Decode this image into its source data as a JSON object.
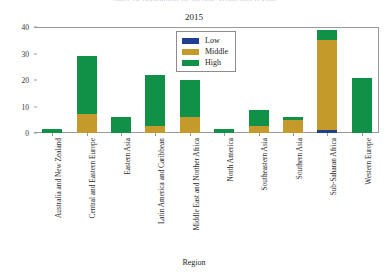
{
  "suptitle": "Share of population by income group and region",
  "axis_title_x": "Region",
  "legend": {
    "position": "top-center-inside",
    "items": [
      {
        "label": "Low",
        "color": "#1f3f8f"
      },
      {
        "label": "Middle",
        "color": "#c49a2b"
      },
      {
        "label": "High",
        "color": "#119148"
      }
    ]
  },
  "chart_data": {
    "type": "bar",
    "title": "2015",
    "xlabel": "Region",
    "ylabel": "",
    "stacked": true,
    "grid": false,
    "ylim": [
      0,
      40
    ],
    "yticks": [
      0,
      10,
      20,
      30,
      40
    ],
    "categories": [
      "Australia and New Zealand",
      "Central and Eastern Europe",
      "Eastern Asia",
      "Latin America and Caribbean",
      "Middle East and Norther Africa",
      "North America",
      "Southeastern Asia",
      "Southern Asia",
      "Sub-Saharan Africa",
      "Western Europe"
    ],
    "series": [
      {
        "name": "Low",
        "color": "#1f3f8f",
        "values": [
          0,
          0,
          0,
          0,
          0,
          0,
          0,
          0,
          1.2,
          0
        ]
      },
      {
        "name": "Middle",
        "color": "#c49a2b",
        "values": [
          0,
          7.0,
          0,
          2.5,
          6.0,
          0,
          2.5,
          5.0,
          33.8,
          0
        ]
      },
      {
        "name": "High",
        "color": "#119148",
        "values": [
          1.6,
          22.0,
          6.0,
          19.5,
          14.0,
          1.6,
          6.0,
          1.0,
          4.0,
          20.8
        ]
      }
    ],
    "totals": [
      1.6,
      29.0,
      6.0,
      22.0,
      20.0,
      1.6,
      8.5,
      6.0,
      39.0,
      20.8
    ]
  }
}
